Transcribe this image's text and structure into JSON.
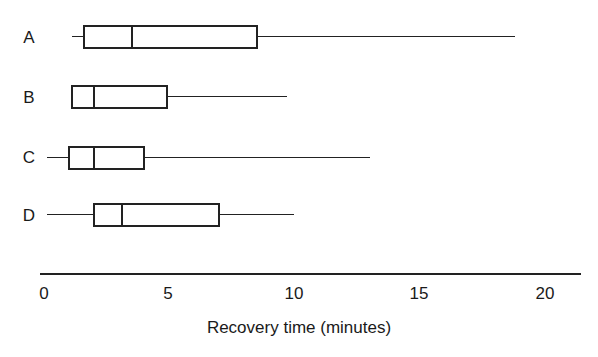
{
  "chart_data": {
    "type": "boxplot",
    "title": "",
    "xlabel": "Recovery time (minutes)",
    "ylabel": "",
    "orientation": "horizontal",
    "xlim": [
      0,
      21.5
    ],
    "xticks": [
      0,
      5,
      10,
      15,
      20
    ],
    "xtick_labels": [
      "0",
      "5",
      "10",
      "15",
      "20"
    ],
    "grid": false,
    "legend": null,
    "categories": [
      "A",
      "B",
      "C",
      "D"
    ],
    "series": [
      {
        "name": "A",
        "min": 1.1,
        "q1": 1.6,
        "median": 3.5,
        "q3": 8.5,
        "max": 18.8
      },
      {
        "name": "B",
        "min": 1.1,
        "q1": 1.1,
        "median": 2.0,
        "q3": 4.9,
        "max": 9.7
      },
      {
        "name": "C",
        "min": 0.1,
        "q1": 1.0,
        "median": 2.0,
        "q3": 4.0,
        "max": 13.0
      },
      {
        "name": "D",
        "min": 0.1,
        "q1": 2.0,
        "median": 3.1,
        "q3": 7.0,
        "max": 10.0
      }
    ]
  },
  "axis": {
    "title": "Recovery time (minutes)",
    "ticks": [
      {
        "value": 0,
        "label": "0"
      },
      {
        "value": 5,
        "label": "5"
      },
      {
        "value": 10,
        "label": "10"
      },
      {
        "value": 15,
        "label": "15"
      },
      {
        "value": 20,
        "label": "20"
      }
    ]
  },
  "colors": {
    "line": "#222222",
    "background": "#ffffff"
  }
}
